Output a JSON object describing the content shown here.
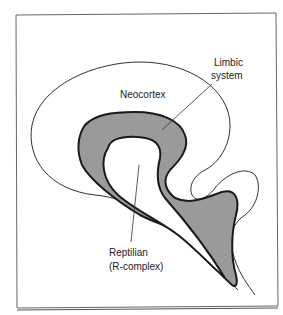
{
  "diagram": {
    "type": "triune-brain",
    "labels": {
      "neocortex": "Neocortex",
      "limbic_line1": "Limbic",
      "limbic_line2": "system",
      "reptilian_line1": "Reptilian",
      "reptilian_line2": "(R-complex)"
    },
    "colors": {
      "limbic_fill": "#9a9a9a",
      "stroke": "#1a1a1a",
      "frame": "#666666",
      "background": "#ffffff"
    }
  }
}
